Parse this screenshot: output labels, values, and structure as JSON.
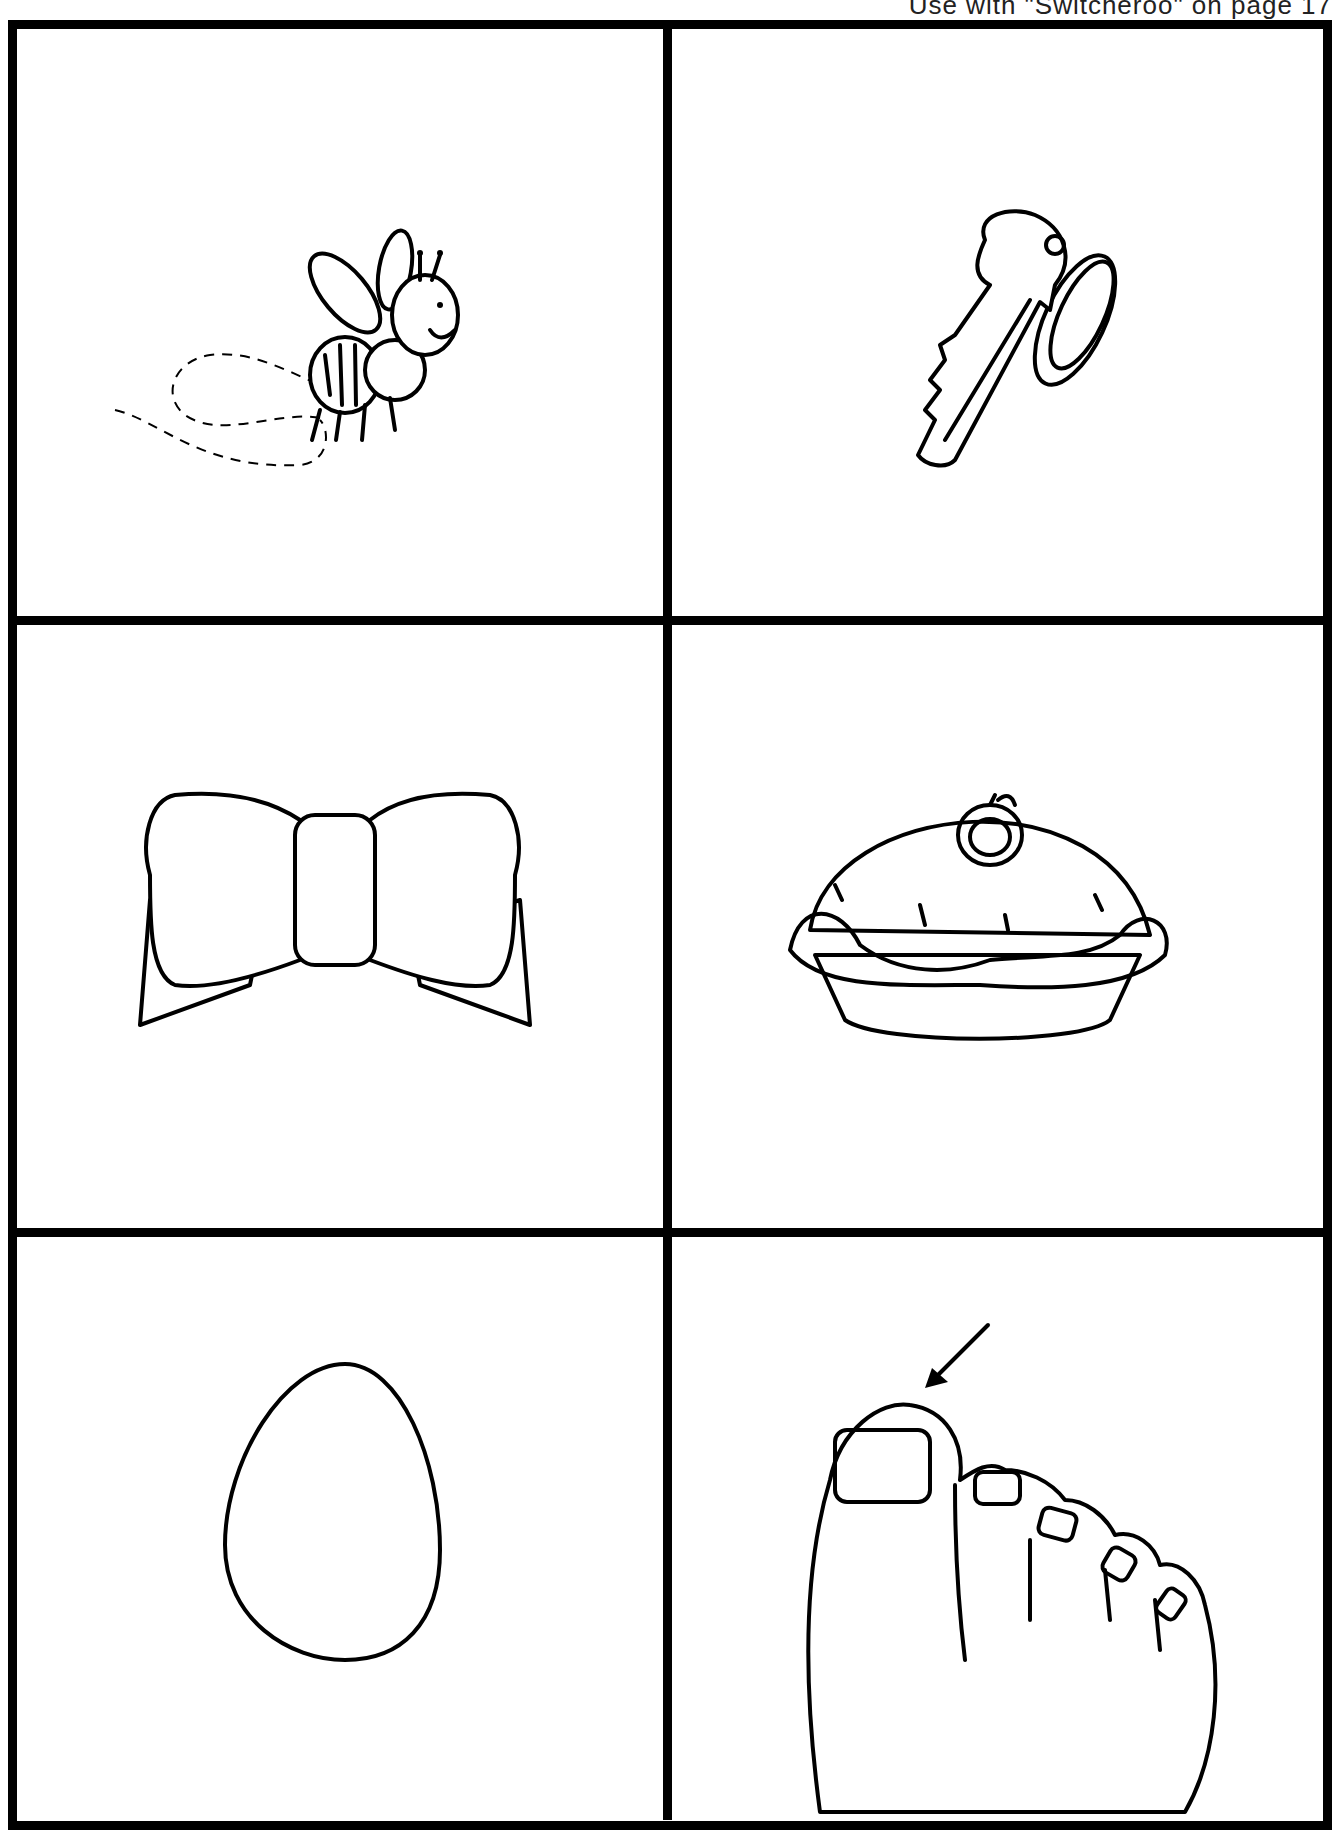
{
  "header": {
    "note": "Use with \"Switcheroo\" on page 17"
  },
  "cards": [
    {
      "label": "bee",
      "icon": "bee-icon"
    },
    {
      "label": "key",
      "icon": "key-icon"
    },
    {
      "label": "bow",
      "icon": "bow-icon"
    },
    {
      "label": "pie",
      "icon": "pie-icon"
    },
    {
      "label": "egg",
      "icon": "egg-icon"
    },
    {
      "label": "toe",
      "icon": "toe-icon"
    }
  ]
}
